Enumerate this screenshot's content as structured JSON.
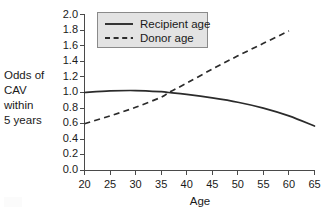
{
  "chart_data": {
    "type": "line",
    "title": "",
    "xlabel": "Age",
    "ylabel": "Odds of CAV within 5 years",
    "ylabel_lines": [
      "Odds of",
      "CAV",
      "within",
      "5 years"
    ],
    "xlim": [
      20,
      65
    ],
    "ylim": [
      0.0,
      2.0
    ],
    "xticks": [
      20,
      25,
      30,
      35,
      40,
      45,
      50,
      55,
      60,
      65
    ],
    "xtick_labels": [
      "20",
      "25",
      "30",
      "35",
      "40",
      "45",
      "50",
      "55",
      "60",
      "65"
    ],
    "yticks": [
      0.0,
      0.2,
      0.4,
      0.6,
      0.8,
      1.0,
      1.2,
      1.4,
      1.6,
      1.8,
      2.0
    ],
    "ytick_labels": [
      "0.0",
      "0.2",
      "0.4",
      "0.6",
      "0.8",
      "1.0",
      "1.2",
      "1.4",
      "1.6",
      "1.8",
      "2.0"
    ],
    "grid": false,
    "legend_position": "top-left-inside",
    "series": [
      {
        "name": "Recipient age",
        "style": "solid",
        "color": "#2b2b2b",
        "x": [
          20,
          25,
          30,
          35,
          36.5,
          40,
          45,
          50,
          55,
          60,
          65
        ],
        "values": [
          1.0,
          1.02,
          1.025,
          1.01,
          1.0,
          0.975,
          0.93,
          0.875,
          0.8,
          0.7,
          0.57
        ]
      },
      {
        "name": "Donor age",
        "style": "dashed",
        "color": "#2b2b2b",
        "x": [
          20,
          25,
          30,
          35,
          36.5,
          40,
          45,
          50,
          55,
          60
        ],
        "values": [
          0.6,
          0.7,
          0.81,
          0.94,
          1.0,
          1.12,
          1.3,
          1.47,
          1.63,
          1.79
        ]
      }
    ]
  },
  "legend": {
    "items": [
      {
        "label": "Recipient age",
        "style": "solid"
      },
      {
        "label": "Donor age",
        "style": "dashed"
      }
    ]
  },
  "axes": {
    "x_title": "Age",
    "y_title_lines": [
      "Odds of",
      "CAV",
      "within",
      "5 years"
    ]
  },
  "colors": {
    "line": "#2b2b2b",
    "axis": "#4a4a4a",
    "legend_fill": "#e3e3e3",
    "legend_border": "#8a8a8a",
    "background": "#ffffff",
    "text": "#1a1a1a"
  }
}
